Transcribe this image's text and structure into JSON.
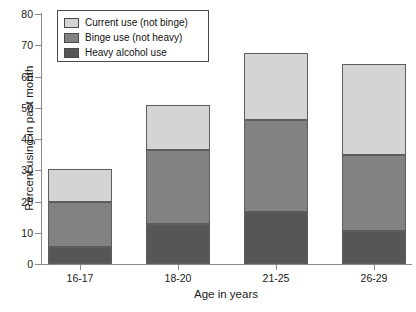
{
  "chart_data": {
    "type": "bar",
    "subtype": "stacked-bar",
    "title": "",
    "xlabel": "Age in years",
    "ylabel": "Percent using in past month",
    "categories": [
      "16-17",
      "18-20",
      "21-25",
      "26-29"
    ],
    "ylim": [
      0,
      80
    ],
    "yticks": [
      0,
      10,
      20,
      30,
      40,
      50,
      60,
      70,
      80
    ],
    "ytick_labels": [
      "0",
      "10",
      "20",
      "30",
      "40",
      "50",
      "60",
      "70",
      "80"
    ],
    "grid": false,
    "legend_position": "upper left",
    "series": [
      {
        "name": "Heavy alcohol use",
        "color": "#565656",
        "values": [
          5.5,
          12.8,
          16.8,
          10.7
        ]
      },
      {
        "name": "Binge use (not heavy)",
        "color": "#828282",
        "values": [
          14.5,
          23.7,
          29.2,
          24.3
        ]
      },
      {
        "name": "Current use (not binge)",
        "color": "#d4d4d4",
        "values": [
          10.3,
          14.3,
          21.4,
          29.0
        ]
      }
    ],
    "cumulative_tops": {
      "heavy": [
        5.5,
        12.8,
        16.8,
        10.7
      ],
      "heavy_plus_binge": [
        20.0,
        36.5,
        46.0,
        35.0
      ],
      "total": [
        30.3,
        50.8,
        67.4,
        64.0
      ]
    }
  },
  "legend": {
    "items": [
      {
        "label": "Current use (not binge)",
        "color": "#d4d4d4"
      },
      {
        "label": "Binge use (not heavy)",
        "color": "#828282"
      },
      {
        "label": "Heavy alcohol use",
        "color": "#565656"
      }
    ]
  }
}
